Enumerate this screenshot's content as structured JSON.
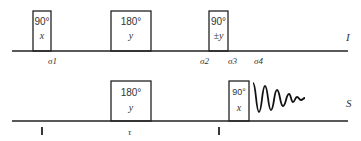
{
  "channels": {
    "I": {
      "label": "I",
      "pulses": [
        {
          "angle": "90°",
          "phase": "x"
        },
        {
          "angle": "180°",
          "phase": "y"
        },
        {
          "angle": "90°",
          "phase": "±y"
        }
      ],
      "time_labels": [
        "σ1",
        "σ2",
        "σ3",
        "σ4"
      ]
    },
    "S": {
      "label": "S",
      "pulses": [
        {
          "angle": "180°",
          "phase": "y"
        },
        {
          "angle": "90°",
          "phase": "x"
        }
      ],
      "time_labels": [
        "τ"
      ],
      "acquisition": "FID"
    }
  }
}
